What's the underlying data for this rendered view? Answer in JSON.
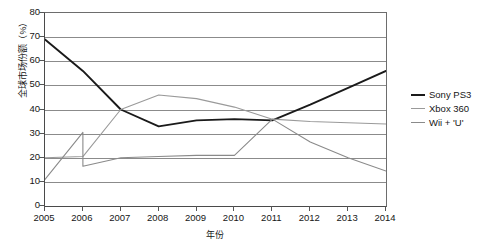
{
  "chart_data": {
    "type": "line",
    "title": "",
    "subtitle": "",
    "xlabel": "年份",
    "ylabel": "全球市场份额（%）",
    "x": [
      2005,
      2006,
      2007,
      2008,
      2009,
      2010,
      2011,
      2012,
      2013,
      2014
    ],
    "xtick_labels": [
      "2005",
      "2006",
      "2007",
      "2008",
      "2009",
      "2010",
      "2011",
      "2012",
      "2013",
      "2014"
    ],
    "ytick_labels": [
      "0",
      "10",
      "20",
      "30",
      "40",
      "50",
      "60",
      "70",
      "80"
    ],
    "yticks": [
      0,
      10,
      20,
      30,
      40,
      50,
      60,
      70,
      80
    ],
    "ylim": [
      0,
      80
    ],
    "xlim": [
      2005,
      2014
    ],
    "grid": "horizontal",
    "legend_position": "right",
    "series": [
      {
        "name": "Sony PS3",
        "color": "#1a1a1a",
        "values": [
          69,
          56,
          40,
          33,
          35.5,
          36,
          35.5,
          42,
          49,
          56
        ]
      },
      {
        "name": "Xbox 360",
        "color": "#9a9a9a",
        "values": [
          20,
          20.5,
          40,
          46,
          44.5,
          41,
          36,
          35,
          34.5,
          34
        ]
      },
      {
        "name": "Wii +  'U'",
        "color": "#8a8a8a",
        "values": [
          11,
          16.5,
          20,
          20.5,
          21,
          21,
          36,
          26.5,
          20,
          14.5
        ]
      }
    ],
    "extra_vertices": [
      {
        "series": "Wii +  'U'",
        "x": 2006,
        "y": 30.5,
        "note": "peak-spike-at-2006"
      }
    ],
    "colors": {
      "axis": "#4a4a4a",
      "grid": "#8b8b8b",
      "text": "#161616",
      "background": "#ffffff"
    }
  },
  "legend": {
    "items": [
      {
        "label": "Sony PS3",
        "color": "#1a1a1a"
      },
      {
        "label": "Xbox 360",
        "color": "#9a9a9a"
      },
      {
        "label": "Wii +  'U'",
        "color": "#8a8a8a"
      }
    ]
  }
}
